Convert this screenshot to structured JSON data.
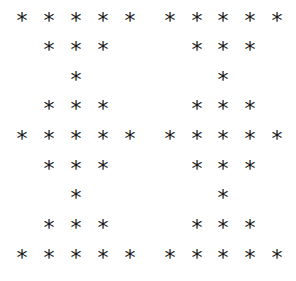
{
  "pattern": {
    "glyph": "*",
    "color": "#1a1a1a",
    "columns_x": [
      22,
      49,
      76,
      103,
      130,
      170,
      197,
      223,
      250,
      277
    ],
    "rows_y": [
      18,
      47,
      77,
      106,
      136,
      166,
      195,
      225,
      255
    ],
    "figures": [
      {
        "name": "left-hourglass-double",
        "rows": [
          [
            1,
            1,
            1,
            1,
            1
          ],
          [
            0,
            1,
            1,
            1,
            0
          ],
          [
            0,
            0,
            1,
            0,
            0
          ],
          [
            0,
            1,
            1,
            1,
            0
          ],
          [
            1,
            1,
            1,
            1,
            1
          ],
          [
            0,
            1,
            1,
            1,
            0
          ],
          [
            0,
            0,
            1,
            0,
            0
          ],
          [
            0,
            1,
            1,
            1,
            0
          ],
          [
            1,
            1,
            1,
            1,
            1
          ]
        ]
      },
      {
        "name": "right-hourglass-double",
        "rows": [
          [
            1,
            1,
            1,
            1,
            1
          ],
          [
            0,
            1,
            1,
            1,
            0
          ],
          [
            0,
            0,
            1,
            0,
            0
          ],
          [
            0,
            1,
            1,
            1,
            0
          ],
          [
            1,
            1,
            1,
            1,
            1
          ],
          [
            0,
            1,
            1,
            1,
            0
          ],
          [
            0,
            0,
            1,
            0,
            0
          ],
          [
            0,
            1,
            1,
            1,
            0
          ],
          [
            1,
            1,
            1,
            1,
            1
          ]
        ]
      }
    ]
  }
}
